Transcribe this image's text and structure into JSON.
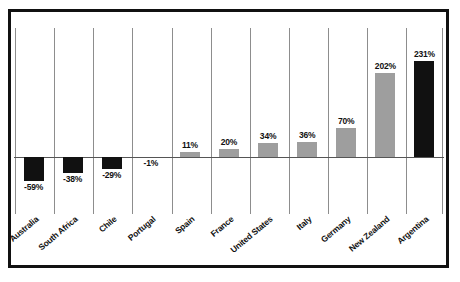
{
  "chart_data": {
    "type": "bar",
    "title": "",
    "subtitle": "",
    "xlabel": "",
    "ylabel": "",
    "categories": [
      "Australia",
      "South Africa",
      "Chile",
      "Portugal",
      "Spain",
      "France",
      "United States",
      "Italy",
      "Germany",
      "New Zealand",
      "Argentina"
    ],
    "values": [
      -59,
      -38,
      -29,
      -1,
      11,
      20,
      34,
      36,
      70,
      202,
      231
    ],
    "data_labels": [
      "-59%",
      "-38%",
      "-29%",
      "-1%",
      "11%",
      "20%",
      "34%",
      "36%",
      "70%",
      "202%",
      "231%"
    ],
    "bar_colors": [
      "#111111",
      "#111111",
      "#111111",
      "#111111",
      "#9e9e9e",
      "#9e9e9e",
      "#9e9e9e",
      "#9e9e9e",
      "#9e9e9e",
      "#9e9e9e",
      "#111111"
    ],
    "ylim": [
      -75,
      250
    ],
    "unit": "%",
    "grid": "vertical-category-separators",
    "legend": "none",
    "zero_line": 0,
    "label_rotation_deg": -40,
    "axis_visible": {
      "x_zero_line": true,
      "y_axis": false,
      "y_ticks": false
    }
  },
  "figure": {
    "background_color": "#ffffff",
    "frame_color": "#111111",
    "gridline_color": "#8d8d8d",
    "zero_line_color": "#555555",
    "accent_gray": "#9e9e9e",
    "accent_black": "#111111"
  }
}
